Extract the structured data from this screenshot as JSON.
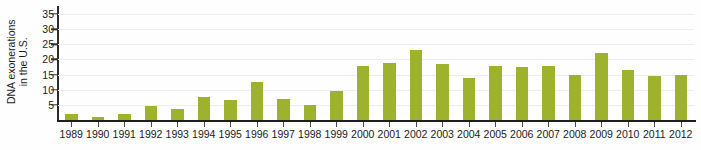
{
  "chart_data": {
    "type": "bar",
    "title": "",
    "xlabel": "",
    "ylabel": "DNA exonerations in the U.S.",
    "ylabel_lines": [
      "DNA exonerations",
      "in the U.S."
    ],
    "categories": [
      "1989",
      "1990",
      "1991",
      "1992",
      "1993",
      "1994",
      "1995",
      "1996",
      "1997",
      "1998",
      "1999",
      "2000",
      "2001",
      "2002",
      "2003",
      "2004",
      "2005",
      "2006",
      "2007",
      "2008",
      "2009",
      "2010",
      "2011",
      "2012"
    ],
    "values": [
      2,
      1,
      2,
      4.5,
      3.5,
      7.5,
      6.5,
      12.5,
      7,
      5,
      9.5,
      18,
      19,
      23,
      18.5,
      14,
      18,
      17.5,
      18,
      15,
      22,
      16.5,
      14.5,
      15
    ],
    "ylim": [
      0,
      37
    ],
    "yticks": [
      5,
      10,
      15,
      20,
      25,
      30,
      35
    ],
    "ytick_labels": [
      "5",
      "10",
      "15",
      "20",
      "25",
      "30",
      "35"
    ],
    "grid": true,
    "legend": false,
    "series": [
      {
        "name": "DNA exonerations",
        "color": "#9fb22e",
        "values": [
          2,
          1,
          2,
          4.5,
          3.5,
          7.5,
          6.5,
          12.5,
          7,
          5,
          9.5,
          18,
          19,
          23,
          18.5,
          14,
          18,
          17.5,
          18,
          15,
          22,
          16.5,
          14.5,
          15
        ]
      }
    ]
  },
  "colors": {
    "bar": "#9fb22e",
    "gridline": "#eceff1",
    "axis": "#1d1d1d",
    "text": "#1b1b1b",
    "background": "#fefefe"
  }
}
